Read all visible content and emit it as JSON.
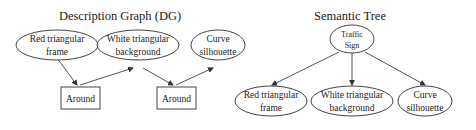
{
  "description_graph": {
    "title": "Description Graph (DG)",
    "ellipses": [
      {
        "id": "red",
        "line1": "Red triangular",
        "line2": "frame"
      },
      {
        "id": "white",
        "line1": "White triangular",
        "line2": "background"
      },
      {
        "id": "curve",
        "line1": "Curve",
        "line2": "silhouette"
      }
    ],
    "boxes": [
      {
        "id": "around1",
        "label": "Around"
      },
      {
        "id": "around2",
        "label": "Around"
      }
    ],
    "edges": [
      {
        "from": "red",
        "to": "around1"
      },
      {
        "from": "around1",
        "to": "white"
      },
      {
        "from": "white",
        "to": "around2"
      },
      {
        "from": "around2",
        "to": "curve"
      }
    ]
  },
  "semantic_tree": {
    "title": "Semantic Tree",
    "root": {
      "line1": "Traffic",
      "line2": "Sign"
    },
    "children": [
      {
        "line1": "Red triangular",
        "line2": "frame"
      },
      {
        "line1": "White triangular",
        "line2": "background"
      },
      {
        "line1": "Curve",
        "line2": "silhouette"
      }
    ]
  }
}
